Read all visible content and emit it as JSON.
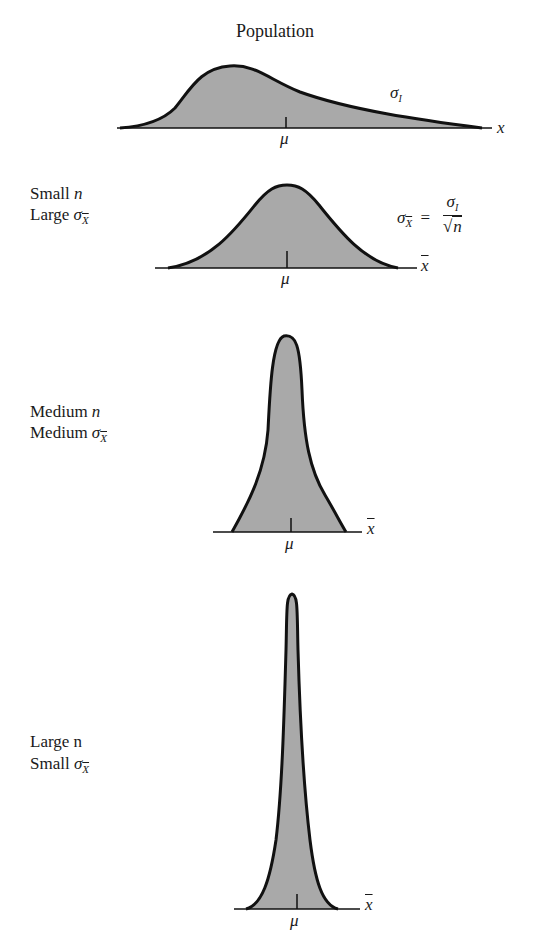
{
  "figure": {
    "title": "Population",
    "panels": [
      {
        "id": "population",
        "axis_label": "x",
        "mean_label": "μ",
        "sd_label": "σ",
        "sd_subscript": "I"
      },
      {
        "id": "small-n",
        "line1_text": "Small ",
        "line1_var": "n",
        "line2_text": "Large ",
        "sd_symbol": "σ",
        "sd_subscript": "X",
        "axis_label": "x",
        "mean_label": "μ"
      },
      {
        "id": "medium-n",
        "line1_text": "Medium ",
        "line1_var": "n",
        "line2_text": "Medium ",
        "sd_symbol": "σ",
        "sd_subscript": "X",
        "axis_label": "x",
        "mean_label": "μ"
      },
      {
        "id": "large-n",
        "line1_text": "Large n",
        "line2_text": "Small ",
        "sd_symbol": "σ",
        "sd_subscript": "X",
        "axis_label": "x",
        "mean_label": "μ"
      }
    ],
    "formula": {
      "lhs_symbol": "σ",
      "lhs_subscript": "X",
      "equals": "=",
      "numerator_symbol": "σ",
      "numerator_subscript": "I",
      "denominator_root": "√",
      "denominator_var": "n"
    },
    "colors": {
      "fill": "#a9a9a9",
      "stroke": "#111111",
      "background": "#ffffff"
    }
  }
}
